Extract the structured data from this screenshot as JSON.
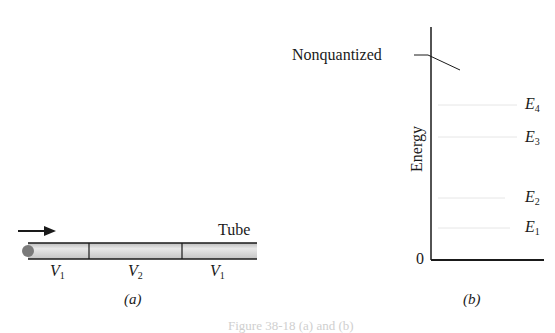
{
  "top_fragment": "",
  "panel_a": {
    "tube_label": "Tube",
    "segments": [
      {
        "base": "V",
        "sub": "1"
      },
      {
        "base": "V",
        "sub": "2"
      },
      {
        "base": "V",
        "sub": "1"
      }
    ],
    "panel_label": "(a)"
  },
  "panel_b": {
    "nonquantized_label": "Nonquantized",
    "axis_label": "Energy",
    "zero_label": "0",
    "levels": [
      {
        "base": "E",
        "sub": "4"
      },
      {
        "base": "E",
        "sub": "3"
      },
      {
        "base": "E",
        "sub": "2"
      },
      {
        "base": "E",
        "sub": "1"
      }
    ],
    "panel_label": "(b)"
  },
  "caption": "Figure 38-18 (a) and (b)",
  "colors": {
    "line": "#1a1a1a",
    "tube_fill": "#d9d9d9",
    "electron": "#7a7a7a",
    "level_line": "#e6e6e6"
  }
}
